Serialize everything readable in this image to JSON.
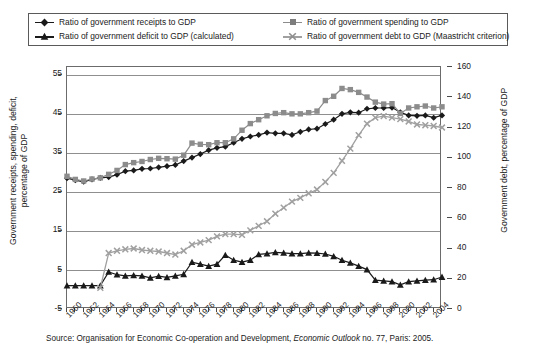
{
  "legend": {
    "items": [
      {
        "label": "Ratio of government receipts to GDP",
        "marker": "diamond-marker-icon",
        "color": "#1a1a1a"
      },
      {
        "label": "Ratio of government spending to GDP",
        "marker": "square-marker-icon",
        "color": "#8c8c8c"
      },
      {
        "label": "Ratio of government deficit to GDP (calculated)",
        "marker": "triangle-marker-icon",
        "color": "#1a1a1a"
      },
      {
        "label": "Ratio of government debt to GDP (Maastricht criterion)",
        "marker": "x-marker-icon",
        "color": "#a0a0a0"
      }
    ]
  },
  "axes": {
    "y_left_title": "Government receipts, spending, deficit,\npercentage of GDP",
    "y_right_title": "Government debt, percentage of GDP",
    "y_left_ticks": [
      "-5",
      "5",
      "15",
      "25",
      "35",
      "45",
      "55"
    ],
    "y_right_ticks": [
      "0",
      "20",
      "40",
      "60",
      "80",
      "100",
      "120",
      "140",
      "160"
    ],
    "x_ticks": [
      "1960",
      "1962",
      "1964",
      "1966",
      "1968",
      "1970",
      "1972",
      "1974",
      "1976",
      "1978",
      "1980",
      "1982",
      "1984",
      "1986",
      "1988",
      "1990",
      "1992",
      "1994",
      "1996",
      "1998",
      "2000",
      "2002",
      "2004"
    ]
  },
  "source": {
    "prefix": "Source: Organisation for Economic Co-operation and Development, ",
    "italic": "Economic Outlook",
    "suffix": " no. 77, Paris: 2005."
  },
  "chart_data": {
    "type": "line",
    "title": "",
    "xlabel": "",
    "ylabel": "Government receipts, spending, deficit, percentage of GDP",
    "ylabel_right": "Government debt, percentage of GDP",
    "grid": true,
    "legend_position": "top",
    "xlim": [
      1960,
      2005
    ],
    "ylim": [
      -5,
      57
    ],
    "ylim_right": [
      0,
      160
    ],
    "x": [
      1960,
      1961,
      1962,
      1963,
      1964,
      1965,
      1966,
      1967,
      1968,
      1969,
      1970,
      1971,
      1972,
      1973,
      1974,
      1975,
      1976,
      1977,
      1978,
      1979,
      1980,
      1981,
      1982,
      1983,
      1984,
      1985,
      1986,
      1987,
      1988,
      1989,
      1990,
      1991,
      1992,
      1993,
      1994,
      1995,
      1996,
      1997,
      1998,
      1999,
      2000,
      2001,
      2002,
      2003,
      2004,
      2005
    ],
    "series": [
      {
        "name": "Ratio of government receipts to GDP",
        "axis": "left",
        "marker": "diamond",
        "color": "#1a1a1a",
        "values": [
          28.5,
          28.0,
          27.6,
          28.2,
          28.6,
          28.8,
          29.4,
          30.3,
          30.5,
          30.9,
          31.0,
          31.3,
          31.6,
          31.9,
          32.9,
          33.8,
          34.7,
          35.7,
          36.3,
          36.6,
          37.6,
          38.6,
          39.2,
          39.6,
          40.2,
          40.0,
          40.0,
          39.6,
          40.4,
          41.0,
          41.2,
          42.4,
          43.5,
          45.0,
          45.4,
          45.3,
          46.3,
          46.5,
          46.5,
          46.6,
          45.4,
          44.6,
          44.5,
          44.6,
          44.0,
          44.6
        ]
      },
      {
        "name": "Ratio of government spending to GDP",
        "axis": "left",
        "marker": "square",
        "color": "#8c8c8c",
        "values": [
          29.0,
          28.2,
          27.8,
          28.3,
          28.6,
          29.5,
          30.5,
          32.0,
          32.5,
          32.8,
          33.3,
          33.6,
          33.5,
          33.4,
          34.4,
          37.5,
          37.2,
          37.1,
          37.6,
          37.6,
          38.6,
          40.8,
          42.5,
          43.5,
          44.5,
          45.1,
          45.3,
          45.0,
          45.0,
          45.3,
          45.7,
          48.4,
          49.5,
          51.5,
          51.2,
          50.5,
          49.3,
          48.0,
          47.5,
          47.6,
          45.1,
          46.5,
          46.8,
          47.0,
          46.5,
          46.8
        ]
      },
      {
        "name": "Ratio of government deficit to GDP (calculated)",
        "axis": "left",
        "marker": "triangle",
        "color": "#1a1a1a",
        "values": [
          1.0,
          1.0,
          1.0,
          1.0,
          1.0,
          4.5,
          3.8,
          3.5,
          3.6,
          3.5,
          3.0,
          3.4,
          3.1,
          3.5,
          3.9,
          7.0,
          6.5,
          6.0,
          6.5,
          8.8,
          7.5,
          7.0,
          7.5,
          9.0,
          9.2,
          9.5,
          9.4,
          9.2,
          9.2,
          9.4,
          9.3,
          9.1,
          8.5,
          7.5,
          6.8,
          6.0,
          5.1,
          2.4,
          2.2,
          2.0,
          1.2,
          2.0,
          2.2,
          2.4,
          2.5,
          3.2
        ]
      },
      {
        "name": "Ratio of government debt to GDP (Maastricht criterion)",
        "axis": "right",
        "marker": "x",
        "color": "#a0a0a0",
        "values": [
          null,
          null,
          null,
          null,
          14.0,
          37.0,
          38.5,
          39.5,
          40.0,
          39.0,
          38.5,
          38.0,
          37.0,
          36.0,
          38.5,
          42.5,
          44.0,
          45.5,
          48.0,
          49.5,
          49.5,
          49.0,
          52.0,
          55.0,
          58.0,
          63.0,
          67.0,
          71.0,
          73.5,
          76.5,
          79.0,
          84.0,
          90.0,
          98.0,
          106.0,
          115.0,
          122.5,
          126.5,
          127.5,
          126.5,
          125.5,
          124.0,
          122.0,
          121.5,
          121.0,
          120.0
        ]
      }
    ]
  },
  "colors": {
    "frame": "#6b6b6b",
    "grid": "#8f8f8f",
    "dark_series": "#1a1a1a",
    "gray_series": "#8c8c8c",
    "light_gray_series": "#a0a0a0",
    "background": "#ffffff"
  }
}
